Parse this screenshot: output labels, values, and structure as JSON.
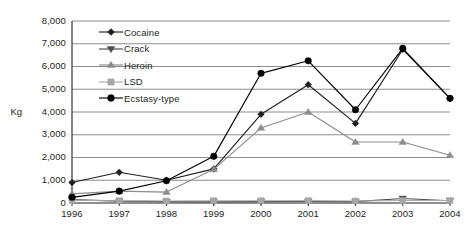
{
  "axis_title": "Kg",
  "legend": [
    {
      "label": "Cocaine",
      "marker": "diamond-marker-icon",
      "color": "#231f20"
    },
    {
      "label": "Crack",
      "marker": "triangle-down-marker-icon",
      "color": "#4d4d4d"
    },
    {
      "label": "Heroin",
      "marker": "triangle-up-marker-icon",
      "color": "#8c8c8c"
    },
    {
      "label": "LSD",
      "marker": "square-marker-icon",
      "color": "#a6a6a6"
    },
    {
      "label": "Ecstasy-type",
      "marker": "circle-marker-icon",
      "color": "#000000"
    }
  ],
  "chart_data": {
    "type": "line",
    "title": "",
    "xlabel": "",
    "ylabel": "Kg",
    "categories": [
      "1996",
      "1997",
      "1998",
      "1999",
      "2000",
      "2001",
      "2002",
      "2003",
      "2004"
    ],
    "x": [
      1996,
      1997,
      1998,
      1999,
      2000,
      2001,
      2002,
      2003,
      2004
    ],
    "ylim": [
      0,
      8000
    ],
    "ytick_values": [
      0,
      1000,
      2000,
      3000,
      4000,
      5000,
      6000,
      7000,
      8000
    ],
    "ytick_labels": [
      "0",
      "1,000",
      "2,000",
      "3,000",
      "4,000",
      "5,000",
      "6,000",
      "7,000",
      "8,000"
    ],
    "grid": "horizontal",
    "legend_position": "inside-top-left",
    "series": [
      {
        "name": "Cocaine",
        "marker": "diamond",
        "color": "#231f20",
        "values": [
          900,
          1350,
          1000,
          1500,
          3900,
          5200,
          3500,
          6750,
          4600
        ]
      },
      {
        "name": "Crack",
        "marker": "triangle-down",
        "color": "#4d4d4d",
        "values": [
          150,
          80,
          60,
          50,
          60,
          70,
          60,
          200,
          100
        ]
      },
      {
        "name": "Heroin",
        "marker": "triangle-up",
        "color": "#8c8c8c",
        "values": [
          400,
          520,
          480,
          1480,
          3300,
          4000,
          2680,
          2680,
          2100
        ]
      },
      {
        "name": "LSD",
        "marker": "square",
        "color": "#a6a6a6",
        "values": [
          120,
          100,
          90,
          100,
          100,
          100,
          90,
          110,
          110
        ]
      },
      {
        "name": "Ecstasy-type",
        "marker": "circle",
        "color": "#000000",
        "values": [
          250,
          520,
          980,
          2050,
          5700,
          6250,
          4100,
          6800,
          4600
        ]
      }
    ]
  },
  "plot_geometry": {
    "left": 72,
    "right": 450,
    "top": 21,
    "bottom": 203
  },
  "style": {
    "grid_color": "#808080",
    "axis_color": "#231f20",
    "background": "#ffffff"
  }
}
